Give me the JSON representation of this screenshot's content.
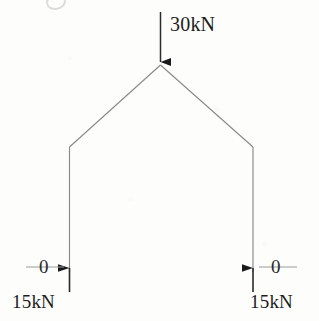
{
  "figure": {
    "type": "free-body-diagram",
    "background_color": "#fdfdfc",
    "line_color": "#8a8a8a",
    "text_color": "#1c1c1c"
  },
  "loads": {
    "applied": {
      "label": "30kN",
      "direction": "down",
      "at": "apex"
    }
  },
  "reactions": {
    "left": {
      "force_label": "15kN",
      "moment_label": "0",
      "direction": "up"
    },
    "right": {
      "force_label": "15kN",
      "moment_label": "0",
      "direction": "up"
    }
  },
  "geometry": {
    "apex": {
      "x": 160,
      "y": 65
    },
    "knee_left": {
      "x": 69,
      "y": 147
    },
    "knee_right": {
      "x": 253,
      "y": 147
    },
    "base_left": {
      "x": 69,
      "y": 272
    },
    "base_right": {
      "x": 253,
      "y": 272
    },
    "load_arrow": {
      "x": 160,
      "y_start": 12,
      "y_end": 63
    }
  }
}
